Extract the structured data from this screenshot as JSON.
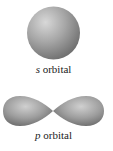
{
  "s_orbital": {
    "letter": "s",
    "word": " orbital",
    "shape": "sphere",
    "color": "#8c8c8c"
  },
  "p_orbital": {
    "letter": "p",
    "word": " orbital",
    "shape": "dumbbell",
    "color": "#8c8c8c"
  }
}
